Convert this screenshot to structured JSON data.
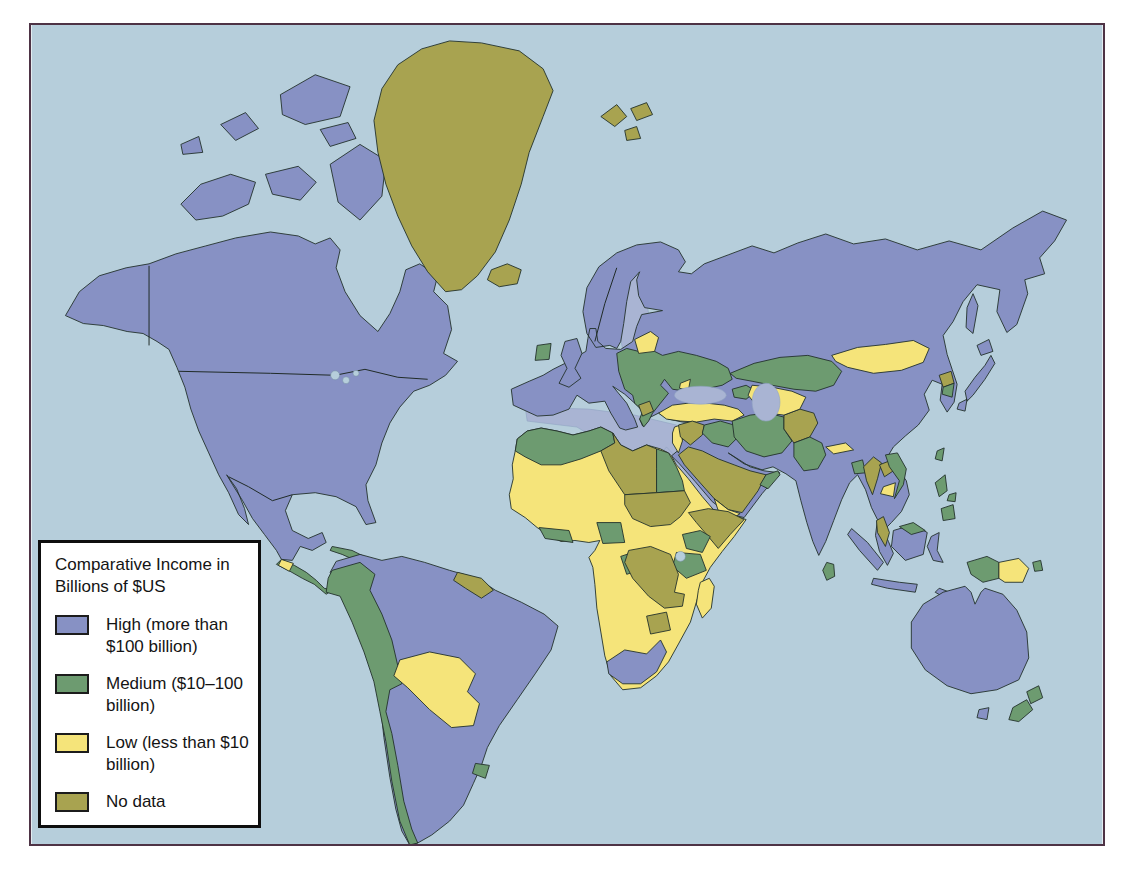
{
  "figure": {
    "background": "#ffffff",
    "frame_border_color": "#4e3345"
  },
  "map": {
    "ocean_color": "#b6cedb",
    "inland_sea_color": "#a9b4d3",
    "border_color": "#23312c"
  },
  "legend": {
    "title": "Comparative Income in Billions of $US",
    "items": [
      {
        "key": "high",
        "label": "High (more than $100 billion)",
        "color": "#8791c4"
      },
      {
        "key": "medium",
        "label": "Medium ($10–100 billion)",
        "color": "#6d9b70"
      },
      {
        "key": "low",
        "label": "Low (less than $10 billion)",
        "color": "#f5e47a"
      },
      {
        "key": "nodata",
        "label": "No data",
        "color": "#a8a350"
      }
    ]
  },
  "regions": {
    "north-america": "high",
    "arctic-islands": "high",
    "greenland": "nodata",
    "iceland": "nodata",
    "svalbard": "nodata",
    "central-america": "medium",
    "guatemala": "low",
    "cuba": "medium",
    "jamaica": "medium",
    "hispaniola": "nodata",
    "south-america": "high",
    "andes": "medium",
    "bolivia-paraguay": "low",
    "guianas": "nodata",
    "uruguay": "medium",
    "eurasia": "high",
    "uk": "high",
    "ireland": "medium",
    "east-europe": "medium",
    "baltics": "low",
    "moldova": "low",
    "balkans-west": "nodata",
    "turkey": "low",
    "caucasus": "medium",
    "levant": "low",
    "syria-jordan": "nodata",
    "iraq": "medium",
    "iran": "medium",
    "arabia": "nodata",
    "yemen": "low",
    "oman": "medium",
    "afghanistan": "nodata",
    "pakistan": "medium",
    "central-asia": "low",
    "kazakhstan": "medium",
    "mongolia": "low",
    "nepal": "low",
    "bangladesh": "medium",
    "myanmar": "nodata",
    "laos": "nodata",
    "vietnam": "medium",
    "cambodia": "low",
    "malay-peninsula": "nodata",
    "north-korea": "nodata",
    "south-korea": "medium",
    "japan": "high",
    "sakhalin": "high",
    "taiwan": "medium",
    "sri-lanka": "medium",
    "philippines": "medium",
    "indonesia": "high",
    "north-borneo": "medium",
    "west-papua": "medium",
    "papua-new-guinea": "low",
    "new-britain": "medium",
    "australia": "high",
    "tasmania": "high",
    "new-zealand": "medium",
    "africa": "low",
    "north-africa": "medium",
    "libya": "nodata",
    "egypt": "medium",
    "sudan": "nodata",
    "somalia": "nodata",
    "kenya-tanzania": "medium",
    "ivory-liberia": "medium",
    "nigeria": "medium",
    "congo": "medium",
    "drc-zambia": "nodata",
    "zimbabwe": "nodata",
    "south-africa": "high",
    "madagascar": "low"
  }
}
